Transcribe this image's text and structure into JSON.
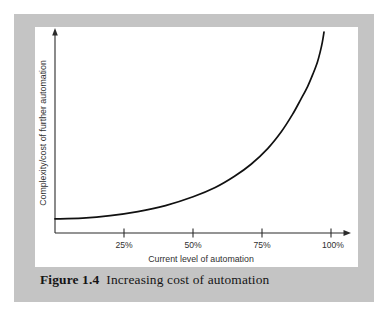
{
  "figure": {
    "caption_number": "Figure 1.4",
    "caption_text": "Increasing cost of automation",
    "panel_color": "#c4c4c4",
    "plot_background": "#ffffff",
    "ink_color": "#111111"
  },
  "chart_data": {
    "type": "line",
    "title": "Increasing cost of automation",
    "xlabel": "Current level of automation",
    "ylabel": "Complexity/cost of further automation",
    "xlim": [
      0,
      105
    ],
    "ylim": [
      0,
      100
    ],
    "grid": false,
    "legend": "none",
    "xtick_values": [
      25,
      50,
      75,
      100
    ],
    "xtick_labels": [
      "25%",
      "50%",
      "75%",
      "100%"
    ],
    "ytick_labels": [],
    "axis_arrows": {
      "x": "right-arrow",
      "y": "up-arrow"
    },
    "series": [
      {
        "name": "Complexity/cost of further automation",
        "x": [
          0,
          10,
          20,
          30,
          40,
          50,
          58,
          65,
          71,
          77,
          82,
          86,
          89,
          91.5,
          93.5,
          95,
          96,
          96.8,
          97.4
        ],
        "y": [
          7,
          7.4,
          8.6,
          10.6,
          13.6,
          18.0,
          22.6,
          28.2,
          34.2,
          42.0,
          50.5,
          59.0,
          66.5,
          73.0,
          79.5,
          85.0,
          90.0,
          95.0,
          100.0
        ]
      }
    ]
  }
}
